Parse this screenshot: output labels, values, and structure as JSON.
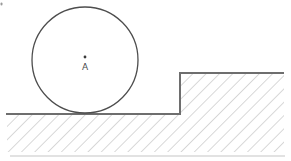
{
  "figure": {
    "center_label": "A",
    "colors": {
      "background": "#ffffff",
      "circle_outline": "#4d4d4d",
      "center_point": "#3a3a3a",
      "label_text": "#4a4a4a",
      "surface_line": "#6e6e6e",
      "hatch_line": "#b9b9b9",
      "stray_mark": "#9a9a9a",
      "bottom_smudge": "#dcdcdc"
    }
  }
}
